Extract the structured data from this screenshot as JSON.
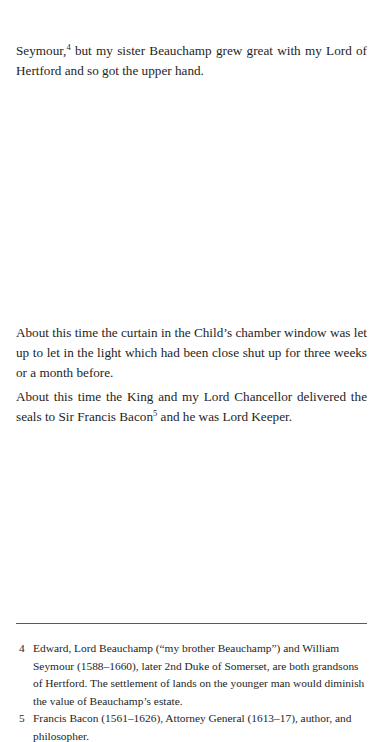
{
  "body": {
    "paragraphs": [
      {
        "before": "Seymour,",
        "footnote_ref": "4",
        "after": " but my sister Beauchamp grew great with my Lord of Hertford and so got the upper hand."
      },
      {
        "text": "About this time the curtain in the Child’s chamber window was let up to let in the light which had been close shut up for three weeks or a month before."
      },
      {
        "before": "About this time the King and my Lord Chancellor delivered the seals to Sir Francis Bacon",
        "footnote_ref": "5",
        "after": " and he was Lord Keeper."
      }
    ]
  },
  "footnotes": [
    {
      "number": "4",
      "text": "Edward, Lord Beauchamp (“my brother Beauchamp”) and William Seymour (1588–1660), later 2nd Duke of Somerset, are both grandsons of Hertford. The settlement of lands on the younger man would diminish the value of Beauchamp’s estate."
    },
    {
      "number": "5",
      "text": "Francis Bacon (1561–1626), Attorney General (1613–17), author, and philosopher."
    }
  ]
}
